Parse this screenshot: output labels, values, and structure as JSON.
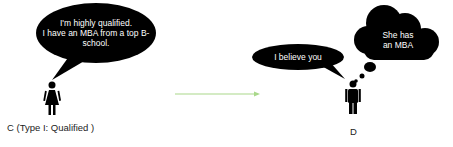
{
  "speaker_c": {
    "speech": [
      "I'm highly qualified.",
      "I have an MBA from a top B-",
      "school."
    ],
    "label": "C (Type I: Qualified )"
  },
  "speaker_d": {
    "speech": "I believe you",
    "thought": [
      "She has",
      "an MBA"
    ],
    "label": "D"
  },
  "arrow": {
    "color": "#a9d88a",
    "direction": "right"
  },
  "colors": {
    "bubble": "#000000",
    "bubble_text": "#ffffff",
    "label_text": "#222222"
  }
}
